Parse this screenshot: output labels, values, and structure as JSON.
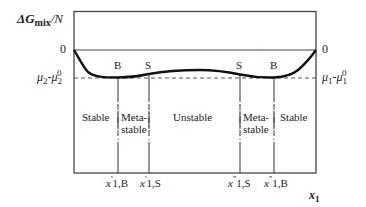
{
  "diagram": {
    "y_axis_label": {
      "main": "ΔG",
      "sub": "mix",
      "tail": "/N"
    },
    "x_axis_label": {
      "main": "x",
      "sub": "1"
    },
    "left_ticks": {
      "zero": "0",
      "mu": {
        "base": "μ",
        "sub": "2",
        "dash": "-μ",
        "sub2": "2",
        "sup": "0"
      }
    },
    "right_ticks": {
      "zero": "0",
      "mu": {
        "base": "μ",
        "sub": "1",
        "dash": "-μ",
        "sub2": "1",
        "sup": "0"
      }
    },
    "curve_points": {
      "left_B": "B",
      "left_S": "S",
      "right_S": "S",
      "right_B": "B"
    },
    "regions": [
      {
        "line1": "Stable",
        "line2": ""
      },
      {
        "line1": "Meta-",
        "line2": "stable"
      },
      {
        "line1": "Unstable",
        "line2": ""
      },
      {
        "line1": "Meta-",
        "line2": "stable"
      },
      {
        "line1": "Stable",
        "line2": ""
      }
    ],
    "x_ticks": [
      {
        "x": "x",
        "prime": "'",
        "sub": "1,B"
      },
      {
        "x": "x",
        "prime": "'",
        "sub": "1,S"
      },
      {
        "x": "x",
        "prime": "''",
        "sub": "1,S"
      },
      {
        "x": "x",
        "prime": "''",
        "sub": "1,B"
      }
    ],
    "colors": {
      "line": "#333333",
      "curve": "#111111",
      "dash": "#555555"
    }
  }
}
